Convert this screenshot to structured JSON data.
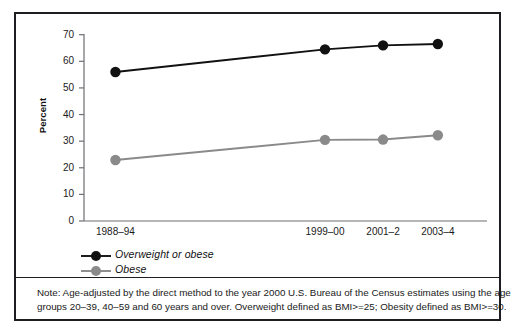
{
  "chart_data": {
    "type": "line",
    "title": "",
    "xlabel": "",
    "ylabel": "Percent",
    "categories": [
      "1988–94",
      "1999–00",
      "2001–2",
      "2003–4"
    ],
    "x_positions_frac": [
      0.078,
      0.598,
      0.742,
      0.878
    ],
    "ylim": [
      0,
      70
    ],
    "yticks": [
      0,
      10,
      20,
      30,
      40,
      50,
      60,
      70
    ],
    "grid": false,
    "legend_position": "below-axis-left",
    "series": [
      {
        "name": "Overweight or obese",
        "color": "#111111",
        "marker": "circle",
        "values": [
          56.0,
          64.5,
          66.0,
          66.5
        ]
      },
      {
        "name": "Obese",
        "color": "#8a8a8a",
        "marker": "circle",
        "values": [
          22.9,
          30.5,
          30.6,
          32.2
        ]
      }
    ]
  },
  "axis": {
    "y_title": "Percent",
    "y_tick_labels": [
      "70",
      "60",
      "50",
      "40",
      "30",
      "20",
      "10",
      "0"
    ],
    "x_tick_labels": [
      "1988–94",
      "1999–00",
      "2001–2",
      "2003–4"
    ]
  },
  "legend": {
    "items": [
      {
        "label": "Overweight or obese",
        "color": "#111111"
      },
      {
        "label": "Obese",
        "color": "#8a8a8a"
      }
    ]
  },
  "note": {
    "line1": "Note: Age-adjusted by the direct method to the year 2000 U.S. Bureau of the Census estimates using the age",
    "line2": "groups 20–39, 40–59 and 60 years and over. Overweight defined as BMI>=25; Obesity defined as BMI>=30."
  },
  "colors": {
    "frame": "#1d1d22",
    "axis": "#6e6e73",
    "series_dark": "#111111",
    "series_gray": "#8a8a8a",
    "background": "#ffffff",
    "text": "#1a1a1a"
  }
}
